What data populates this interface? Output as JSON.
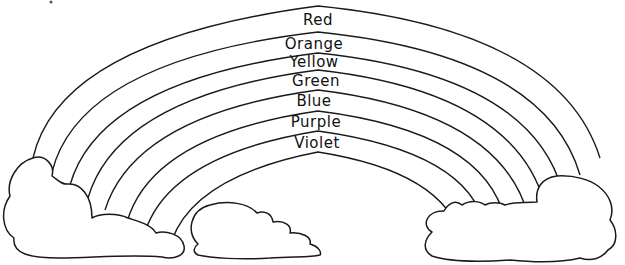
{
  "rainbow": {
    "bands": [
      {
        "label": "Red"
      },
      {
        "label": "Orange"
      },
      {
        "label": "Yellow"
      },
      {
        "label": "Green"
      },
      {
        "label": "Blue"
      },
      {
        "label": "Purple"
      },
      {
        "label": "Violet"
      }
    ]
  },
  "clouds": [
    "left-cloud",
    "middle-cloud",
    "right-cloud"
  ],
  "colors": {
    "line": "#1a1a1a",
    "background": "#ffffff"
  }
}
